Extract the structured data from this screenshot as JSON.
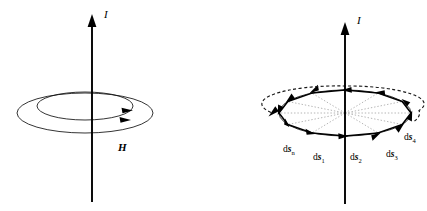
{
  "figure": {
    "background_color": "#ffffff",
    "ink_color": "#000000",
    "dotted_color": "#8d8d8d",
    "width": 427,
    "height": 211
  },
  "panels": [
    {
      "id": "left-panel",
      "name": "field-lines-panel",
      "current_label": "I",
      "field_label": "H",
      "axis": {
        "x": 92,
        "y_top": 18,
        "y_bottom": 202,
        "arrow_direction": "up",
        "label": "I",
        "label_x": 104,
        "label_y": 16
      },
      "field_loops": [
        {
          "name": "outer-field-loop",
          "cx": 85,
          "cy": 113,
          "rx": 68,
          "ry": 20,
          "arrow_angle_deg": 22
        },
        {
          "name": "inner-field-loop",
          "cx": 85,
          "cy": 106,
          "rx": 48,
          "ry": 14,
          "arrow_angle_deg": 24
        }
      ],
      "field_label_position": {
        "x": 118,
        "y": 149
      }
    },
    {
      "id": "right-panel",
      "name": "line-elements-panel",
      "current_label": "I",
      "axis": {
        "x": 345,
        "y_top": 26,
        "y_bottom": 204,
        "arrow_direction": "up",
        "label": "I",
        "label_x": 357,
        "label_y": 22
      },
      "loop": {
        "name": "current-loop-ellipse",
        "cx": 345,
        "cy": 113,
        "rx": 66,
        "ry": 23
      },
      "dashed_arc": {
        "name": "circulation-arc",
        "cx": 345,
        "cy": 104,
        "rx": 76,
        "ry": 18,
        "start_angle_deg": 186,
        "end_angle_deg": 352,
        "has_arrowhead_left": true
      },
      "segments_count": 12,
      "ds_labels": [
        {
          "name": "ds-n-label",
          "d": "d",
          "s": "s",
          "sub": "n",
          "x": 283,
          "y": 152
        },
        {
          "name": "ds-1-label",
          "d": "d",
          "s": "s",
          "sub": "1",
          "x": 313,
          "y": 160
        },
        {
          "name": "ds-2-label",
          "d": "d",
          "s": "s",
          "sub": "2",
          "x": 350,
          "y": 160
        },
        {
          "name": "ds-3-label",
          "d": "d",
          "s": "s",
          "sub": "3",
          "x": 386,
          "y": 157
        },
        {
          "name": "ds-4-label",
          "d": "d",
          "s": "s",
          "sub": "4",
          "x": 404,
          "y": 140
        }
      ]
    }
  ]
}
